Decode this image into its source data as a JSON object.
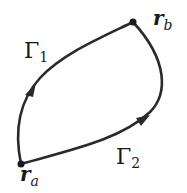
{
  "diagram": {
    "type": "path-diagram",
    "stroke_color": "#2a2a2a",
    "points": [
      {
        "id": "ra",
        "base": "r",
        "sub": "a",
        "x": 21,
        "y": 164
      },
      {
        "id": "rb",
        "base": "r",
        "sub": "b",
        "x": 133,
        "y": 22
      }
    ],
    "paths": [
      {
        "id": "gamma1",
        "base": "Γ",
        "sub": "1",
        "from": "ra",
        "to": "rb"
      },
      {
        "id": "gamma2",
        "base": "Γ",
        "sub": "2",
        "from": "ra",
        "to": "rb"
      }
    ]
  }
}
